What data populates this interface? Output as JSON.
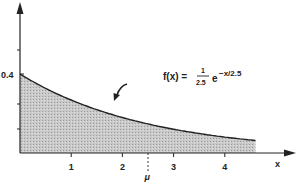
{
  "chart_data": {
    "type": "area",
    "title": "",
    "function_label": "f(x) = (1/2.5) e^(-x/2.5)",
    "formula": {
      "lhs": "f(x) =",
      "numerator": "1",
      "denominator": "2.5",
      "base": "e",
      "exponent": "−x/2.5"
    },
    "xlabel": "x",
    "ylabel": "",
    "x_ticks": [
      "1",
      "2",
      "3",
      "4"
    ],
    "y_ticks": [
      "0.4"
    ],
    "mean_marker": {
      "label": "μ",
      "x": 2.5
    },
    "xlim": [
      0,
      4.6
    ],
    "ylim": [
      0,
      0.55
    ],
    "x": [
      0,
      0.5,
      1,
      1.5,
      2,
      2.5,
      3,
      3.5,
      4,
      4.6
    ],
    "values": [
      0.4,
      0.327,
      0.268,
      0.22,
      0.18,
      0.147,
      0.12,
      0.099,
      0.081,
      0.064
    ],
    "grid": false,
    "fill": "shaded (stippled gray)"
  }
}
